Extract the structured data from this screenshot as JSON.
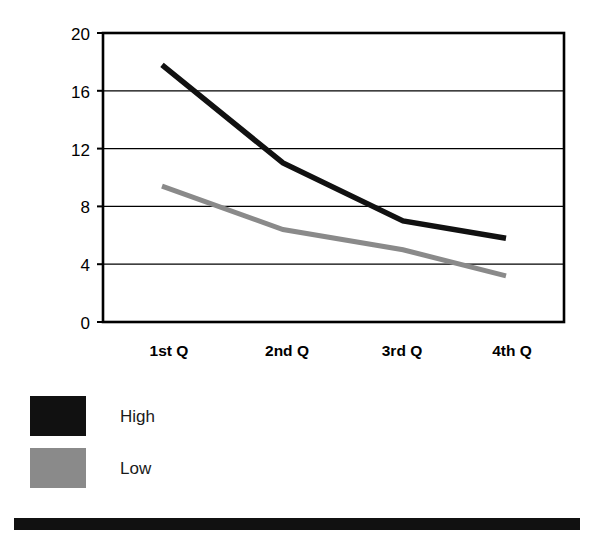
{
  "chart_data": {
    "type": "line",
    "title": "",
    "subtitle": "",
    "xlabel": "",
    "ylabel": "",
    "categories": [
      "1st Q",
      "2nd Q",
      "3rd Q",
      "4th Q"
    ],
    "series": [
      {
        "name": "High",
        "color": "#111111",
        "values": [
          17.8,
          11.0,
          7.0,
          5.8
        ]
      },
      {
        "name": "Low",
        "color": "#8a8a8a",
        "values": [
          9.4,
          6.4,
          5.0,
          3.2
        ]
      }
    ],
    "ylim": [
      0,
      20
    ],
    "yticks": [
      0,
      4,
      8,
      12,
      16,
      20
    ],
    "ytick_labels": [
      "0",
      "4",
      "8",
      "12",
      "16",
      "20"
    ],
    "grid": "horizontal",
    "grid_color": "#000000",
    "plot_border": true,
    "legend_position": "below-left",
    "legend_entries": [
      {
        "label": "High",
        "color": "#111111"
      },
      {
        "label": "Low",
        "color": "#8a8a8a"
      }
    ]
  },
  "axis": {
    "y_labels": [
      "20",
      "16",
      "12",
      "8",
      "4",
      "0"
    ],
    "x_labels": [
      "1st Q",
      "2nd Q",
      "3rd Q",
      "4th Q"
    ]
  },
  "legend": {
    "rows": [
      {
        "label": "High"
      },
      {
        "label": "Low"
      }
    ]
  },
  "colors": {
    "series_high": "#111111",
    "series_low": "#8a8a8a",
    "axis": "#000000",
    "background": "#ffffff",
    "bottom_bar": "#111111"
  }
}
